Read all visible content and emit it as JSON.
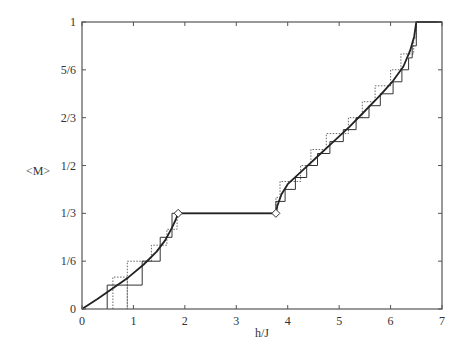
{
  "chart_data": {
    "type": "line",
    "title": "",
    "xlabel": "h/J",
    "ylabel": "<M>",
    "xlim": [
      0,
      7
    ],
    "ylim": [
      0,
      1
    ],
    "grid": false,
    "legend": null,
    "x_ticks": [
      {
        "value": 0,
        "label": "0"
      },
      {
        "value": 1,
        "label": "1"
      },
      {
        "value": 2,
        "label": "2"
      },
      {
        "value": 3,
        "label": "3"
      },
      {
        "value": 4,
        "label": "4"
      },
      {
        "value": 5,
        "label": "5"
      },
      {
        "value": 6,
        "label": "6"
      },
      {
        "value": 7,
        "label": "7"
      }
    ],
    "y_ticks": [
      {
        "value": 0,
        "label": "0"
      },
      {
        "value": 0.16667,
        "label": "1/6"
      },
      {
        "value": 0.33333,
        "label": "1/3"
      },
      {
        "value": 0.5,
        "label": "1/2"
      },
      {
        "value": 0.66667,
        "label": "2/3"
      },
      {
        "value": 0.83333,
        "label": "5/6"
      },
      {
        "value": 1,
        "label": "1"
      }
    ],
    "series": [
      {
        "name": "thermodynamic-limit curve",
        "style": "solid-thick",
        "points": [
          [
            0,
            0
          ],
          [
            0.3,
            0.035
          ],
          [
            0.6,
            0.072
          ],
          [
            0.9,
            0.11
          ],
          [
            1.2,
            0.155
          ],
          [
            1.45,
            0.2
          ],
          [
            1.62,
            0.24
          ],
          [
            1.74,
            0.28
          ],
          [
            1.82,
            0.31
          ],
          [
            1.87,
            0.3333
          ],
          [
            3.77,
            0.3333
          ],
          [
            3.8,
            0.36
          ],
          [
            3.88,
            0.4
          ],
          [
            4.0,
            0.435
          ],
          [
            4.3,
            0.485
          ],
          [
            4.6,
            0.535
          ],
          [
            4.9,
            0.585
          ],
          [
            5.2,
            0.635
          ],
          [
            5.5,
            0.69
          ],
          [
            5.8,
            0.745
          ],
          [
            6.05,
            0.795
          ],
          [
            6.25,
            0.845
          ],
          [
            6.38,
            0.9
          ],
          [
            6.46,
            0.95
          ],
          [
            6.5,
            1.0
          ],
          [
            7,
            1.0
          ]
        ]
      },
      {
        "name": "finite chain (solid staircase)",
        "style": "solid-thin",
        "points": [
          [
            0.49,
            0
          ],
          [
            0.49,
            0.0833
          ],
          [
            1.17,
            0.0833
          ],
          [
            1.17,
            0.1667
          ],
          [
            1.52,
            0.1667
          ],
          [
            1.52,
            0.25
          ],
          [
            1.75,
            0.25
          ],
          [
            1.75,
            0.3333
          ],
          [
            1.87,
            0.3333
          ],
          [
            3.77,
            0.3333
          ],
          [
            3.77,
            0.375
          ],
          [
            3.95,
            0.375
          ],
          [
            3.95,
            0.4167
          ],
          [
            4.15,
            0.4167
          ],
          [
            4.15,
            0.4583
          ],
          [
            4.37,
            0.4583
          ],
          [
            4.37,
            0.5
          ],
          [
            4.58,
            0.5
          ],
          [
            4.58,
            0.5417
          ],
          [
            4.82,
            0.5417
          ],
          [
            4.82,
            0.5833
          ],
          [
            5.08,
            0.5833
          ],
          [
            5.08,
            0.625
          ],
          [
            5.33,
            0.625
          ],
          [
            5.33,
            0.6667
          ],
          [
            5.58,
            0.6667
          ],
          [
            5.58,
            0.7083
          ],
          [
            5.8,
            0.7083
          ],
          [
            5.8,
            0.75
          ],
          [
            6.05,
            0.75
          ],
          [
            6.05,
            0.7917
          ],
          [
            6.22,
            0.7917
          ],
          [
            6.22,
            0.8333
          ],
          [
            6.35,
            0.8333
          ],
          [
            6.35,
            0.875
          ],
          [
            6.42,
            0.875
          ],
          [
            6.42,
            0.9167
          ],
          [
            6.5,
            0.9167
          ],
          [
            6.5,
            1.0
          ]
        ]
      },
      {
        "name": "finite chain (dotted staircase)",
        "style": "dotted",
        "points": [
          [
            0.6,
            0
          ],
          [
            0.6,
            0.1111
          ],
          [
            0.88,
            0.1111
          ],
          [
            0.88,
            0
          ],
          [
            0.88,
            0.1667
          ],
          [
            1.35,
            0.1667
          ],
          [
            1.35,
            0.2222
          ],
          [
            1.65,
            0.2222
          ],
          [
            1.65,
            0.2778
          ],
          [
            1.85,
            0.2778
          ],
          [
            1.85,
            0.3333
          ],
          [
            3.77,
            0.3333
          ],
          [
            3.77,
            0.3889
          ],
          [
            3.85,
            0.3889
          ],
          [
            3.85,
            0.4444
          ],
          [
            4.25,
            0.4444
          ],
          [
            4.25,
            0.5
          ],
          [
            4.45,
            0.5
          ],
          [
            4.45,
            0.5556
          ],
          [
            4.75,
            0.5556
          ],
          [
            4.75,
            0.6111
          ],
          [
            5.18,
            0.6111
          ],
          [
            5.18,
            0.6667
          ],
          [
            5.45,
            0.6667
          ],
          [
            5.45,
            0.7222
          ],
          [
            5.7,
            0.7222
          ],
          [
            5.7,
            0.7778
          ],
          [
            6.0,
            0.7778
          ],
          [
            6.0,
            0.8333
          ],
          [
            6.2,
            0.8333
          ],
          [
            6.2,
            0.8889
          ],
          [
            6.45,
            0.8889
          ],
          [
            6.45,
            0.9444
          ],
          [
            6.5,
            0.9444
          ],
          [
            6.5,
            1.0
          ]
        ]
      }
    ],
    "markers": [
      {
        "shape": "diamond",
        "x": 1.87,
        "y": 0.3333
      },
      {
        "shape": "diamond",
        "x": 3.77,
        "y": 0.3333
      }
    ],
    "plateau": {
      "from": 1.87,
      "to": 3.77,
      "value": "1/3"
    }
  }
}
